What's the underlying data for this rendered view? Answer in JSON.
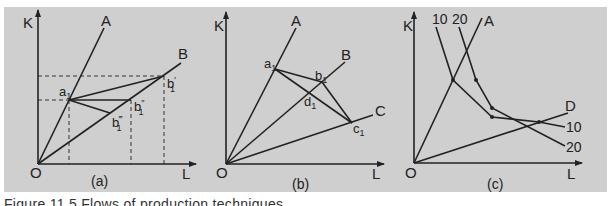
{
  "colors": {
    "panel_bg": "#cfcfcf",
    "ink": "#222222",
    "page_bg": "#ffffff"
  },
  "caption": "Figure 11.5  Flows of production techniques",
  "panels": [
    {
      "id": "a",
      "label": "(a)",
      "label_pos": [
        91,
        186
      ],
      "origin": [
        38,
        164
      ],
      "origin_label": "O",
      "origin_label_pos": [
        30,
        178
      ],
      "axis_y_end": [
        38,
        10
      ],
      "axis_x_end": [
        196,
        164
      ],
      "y_axis_label": "K",
      "y_axis_label_pos": [
        23,
        28
      ],
      "x_axis_label": "L",
      "x_axis_label_pos": [
        182,
        179
      ],
      "rays": [
        {
          "name": "A",
          "end": [
            104,
            28
          ],
          "label_pos": [
            101,
            26
          ]
        },
        {
          "name": "B",
          "end": [
            181,
            63
          ],
          "label_pos": [
            178,
            59
          ]
        }
      ],
      "points": [
        {
          "name": "a1",
          "main": "a",
          "sub": "1",
          "sup": "",
          "at": [
            69,
            100
          ],
          "label_pos": [
            59,
            96
          ]
        },
        {
          "name": "b1-prime",
          "main": "b",
          "sub": "1",
          "sup": "′",
          "at": [
            164,
            76
          ],
          "label_pos": [
            167,
            88
          ]
        },
        {
          "name": "b1-double-prime",
          "main": "b",
          "sub": "1",
          "sup": "″",
          "at": [
            131,
            100
          ],
          "label_pos": [
            134,
            111
          ]
        },
        {
          "name": "b1-triple-prime",
          "main": "b",
          "sub": "1",
          "sup": "‴",
          "at": [
            110,
            113
          ],
          "label_pos": [
            112,
            127
          ]
        }
      ],
      "segments": [
        {
          "from": [
            69,
            100
          ],
          "to": [
            164,
            76
          ]
        },
        {
          "from": [
            69,
            100
          ],
          "to": [
            131,
            100
          ]
        },
        {
          "from": [
            69,
            100
          ],
          "to": [
            110,
            113
          ]
        }
      ],
      "dashed": [
        {
          "from": [
            38,
            76
          ],
          "to": [
            164,
            76
          ]
        },
        {
          "from": [
            38,
            100
          ],
          "to": [
            69,
            100
          ]
        },
        {
          "from": [
            69,
            100
          ],
          "to": [
            69,
            164
          ]
        },
        {
          "from": [
            131,
            100
          ],
          "to": [
            131,
            164
          ]
        },
        {
          "from": [
            164,
            76
          ],
          "to": [
            164,
            164
          ]
        }
      ]
    },
    {
      "id": "b",
      "label": "(b)",
      "label_pos": [
        292,
        189
      ],
      "origin": [
        226,
        164
      ],
      "origin_label": "O",
      "origin_label_pos": [
        216,
        178
      ],
      "axis_y_end": [
        226,
        12
      ],
      "axis_x_end": [
        384,
        164
      ],
      "y_axis_label": "K",
      "y_axis_label_pos": [
        214,
        31
      ],
      "x_axis_label": "L",
      "x_axis_label_pos": [
        372,
        179
      ],
      "rays": [
        {
          "name": "A",
          "end": [
            296,
            28
          ],
          "label_pos": [
            291,
            26
          ]
        },
        {
          "name": "B",
          "end": [
            345,
            62
          ],
          "label_pos": [
            341,
            60
          ]
        },
        {
          "name": "C",
          "end": [
            373,
            115
          ],
          "label_pos": [
            375,
            116
          ]
        }
      ],
      "points": [
        {
          "name": "a1",
          "main": "a",
          "sub": "1",
          "sup": "",
          "at": [
            275,
            69
          ],
          "label_pos": [
            264,
            68
          ]
        },
        {
          "name": "b1",
          "main": "b",
          "sub": "1",
          "sup": "",
          "at": [
            322,
            82
          ],
          "label_pos": [
            315,
            80
          ]
        },
        {
          "name": "d1",
          "main": "d",
          "sub": "1",
          "sup": "",
          "at": [
            308,
            93
          ],
          "label_pos": [
            304,
            106
          ]
        },
        {
          "name": "c1",
          "main": "c",
          "sub": "1",
          "sup": "",
          "at": [
            352,
            123
          ],
          "label_pos": [
            353,
            133
          ]
        }
      ],
      "segments": [
        {
          "from": [
            275,
            69
          ],
          "to": [
            322,
            82
          ]
        },
        {
          "from": [
            322,
            82
          ],
          "to": [
            352,
            123
          ]
        },
        {
          "from": [
            275,
            69
          ],
          "to": [
            352,
            123
          ]
        }
      ],
      "dashed": []
    },
    {
      "id": "c",
      "label": "(c)",
      "label_pos": [
        487,
        189
      ],
      "origin": [
        414,
        163
      ],
      "origin_label": "O",
      "origin_label_pos": [
        405,
        178
      ],
      "axis_y_end": [
        414,
        12
      ],
      "axis_x_end": [
        582,
        163
      ],
      "y_axis_label": "K",
      "y_axis_label_pos": [
        403,
        31
      ],
      "x_axis_label": "L",
      "x_axis_label_pos": [
        567,
        179
      ],
      "rays": [
        {
          "name": "A",
          "end": [
            482,
            18
          ],
          "label_pos": [
            484,
            26
          ]
        },
        {
          "name": "D",
          "end": [
            568,
            113
          ],
          "label_pos": [
            565,
            111
          ]
        }
      ],
      "isoquants": [
        {
          "name": "10",
          "label_top": "10",
          "label_top_pos": [
            432,
            24
          ],
          "label_end": "10",
          "label_end_pos": [
            566,
            132
          ],
          "path": [
            [
              436,
              27
            ],
            [
              453,
              80
            ],
            [
              492,
              117
            ],
            [
              539,
              122
            ],
            [
              565,
              127
            ]
          ]
        },
        {
          "name": "20",
          "label_top": "20",
          "label_top_pos": [
            452,
            24
          ],
          "label_end": "20",
          "label_end_pos": [
            566,
            152
          ],
          "path": [
            [
              459,
              27
            ],
            [
              476,
              80
            ],
            [
              492,
              108
            ],
            [
              565,
              146
            ]
          ]
        }
      ],
      "dots": [
        [
          453,
          80
        ],
        [
          476,
          80
        ],
        [
          492,
          108
        ],
        [
          492,
          117
        ],
        [
          539,
          122
        ]
      ],
      "points": [],
      "segments": [],
      "dashed": []
    }
  ]
}
